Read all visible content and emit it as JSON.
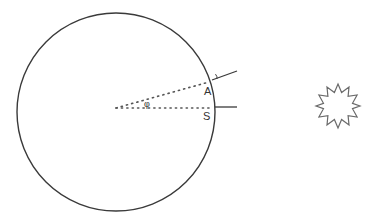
{
  "diagram": {
    "type": "geometry",
    "colors": {
      "stroke": "#3a3a3a",
      "dotted": "#555555",
      "star": "#6a6a6a",
      "text": "#333333",
      "background": "#ffffff"
    },
    "circle": {
      "cx": 116,
      "cy": 112,
      "r": 99
    },
    "center_point": {
      "x": 116,
      "y": 108
    },
    "points": [
      {
        "id": "A",
        "label": "A",
        "x": 212,
        "y": 81
      },
      {
        "id": "S",
        "label": "S",
        "x": 215,
        "y": 107
      }
    ],
    "labels": {
      "point_a": "A",
      "point_s": "S",
      "angle": "φ",
      "angle_small": "ε"
    },
    "lines": {
      "radius_to_a": {
        "style": "dotted",
        "from": [
          116,
          108
        ],
        "to": [
          211,
          81
        ]
      },
      "radius_to_s": {
        "style": "dotted",
        "from": [
          116,
          108
        ],
        "to": [
          213,
          108
        ]
      },
      "ray_at_s": {
        "style": "solid",
        "from": [
          215,
          107
        ],
        "to": [
          237,
          107
        ]
      },
      "ray_at_a": {
        "style": "solid",
        "from": [
          212,
          80
        ],
        "to": [
          237,
          71
        ]
      }
    },
    "sun": {
      "shape": "star",
      "points": 12,
      "cx": 338,
      "cy": 106,
      "outer_r": 22,
      "inner_r": 14
    }
  }
}
